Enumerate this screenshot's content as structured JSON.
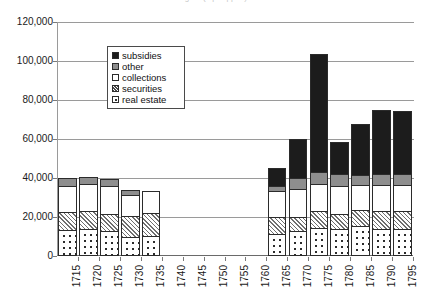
{
  "title_clipped": "Figure (top clipped)",
  "chart_data": {
    "type": "bar",
    "subtype": "stacked",
    "title": "",
    "xlabel": "",
    "ylabel": "",
    "ylim": [
      0,
      120000
    ],
    "ytick_step": 20000,
    "ytick_labels": [
      "0",
      "20,000",
      "40,000",
      "60,000",
      "80,000",
      "100,000",
      "120,000"
    ],
    "ytick_values": [
      0,
      20000,
      40000,
      60000,
      80000,
      100000,
      120000
    ],
    "grid": true,
    "grid_axis": "y",
    "legend_position": "upper-left-inside",
    "categories": [
      "1715",
      "1720",
      "1725",
      "1730",
      "1735",
      "1740",
      "1745",
      "1750",
      "1755",
      "1760",
      "1765",
      "1770",
      "1775",
      "1780",
      "1785",
      "1790",
      "1795"
    ],
    "series": [
      {
        "name": "real estate",
        "color": "#ffffff",
        "pattern": "dotted",
        "values": [
          13000,
          13500,
          12500,
          9000,
          9500,
          0,
          0,
          0,
          0,
          0,
          11000,
          12500,
          14000,
          13500,
          15000,
          13500,
          13500
        ]
      },
      {
        "name": "securities",
        "color": "#ffffff",
        "pattern": "hatched",
        "values": [
          9000,
          9000,
          8500,
          11000,
          12000,
          0,
          0,
          0,
          0,
          0,
          8500,
          7000,
          8500,
          7500,
          8000,
          9000,
          9000
        ]
      },
      {
        "name": "collections",
        "color": "#ffffff",
        "pattern": "solid",
        "values": [
          13500,
          14000,
          14500,
          11000,
          11500,
          0,
          0,
          0,
          0,
          0,
          13500,
          14500,
          14000,
          14500,
          13000,
          13500,
          13500
        ]
      },
      {
        "name": "other",
        "color": "#8e8e8e",
        "pattern": "solid",
        "values": [
          4000,
          3500,
          3500,
          2500,
          0,
          0,
          0,
          0,
          0,
          0,
          2500,
          5500,
          6000,
          6000,
          5000,
          5500,
          5500
        ]
      },
      {
        "name": "subsidies",
        "color": "#1c1c1c",
        "pattern": "solid",
        "values": [
          0,
          0,
          0,
          0,
          0,
          0,
          0,
          0,
          0,
          0,
          9000,
          20000,
          60500,
          16500,
          26000,
          33000,
          32500
        ]
      }
    ],
    "totals": [
      39500,
      40000,
      39000,
      33500,
      33000,
      0,
      0,
      0,
      0,
      0,
      44500,
      59500,
      103000,
      58000,
      67000,
      74500,
      74000
    ],
    "empty_categories": [
      "1740",
      "1745",
      "1750",
      "1755",
      "1760"
    ]
  },
  "legend": {
    "items": [
      {
        "label": "subsidies",
        "key": "subsidies"
      },
      {
        "label": "other",
        "key": "other"
      },
      {
        "label": "collections",
        "key": "collections"
      },
      {
        "label": "securities",
        "key": "securities"
      },
      {
        "label": "real estate",
        "key": "realestate"
      }
    ]
  }
}
